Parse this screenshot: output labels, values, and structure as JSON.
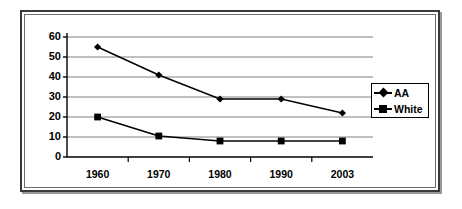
{
  "chart_data": {
    "type": "line",
    "title": "",
    "subtitle": "",
    "xlabel": "",
    "ylabel": "",
    "categories": [
      "1960",
      "1970",
      "1980",
      "1990",
      "2003"
    ],
    "series": [
      {
        "name": "AA",
        "marker": "diamond",
        "color": "#000000",
        "values": [
          55,
          41,
          29,
          29,
          22
        ]
      },
      {
        "name": "White",
        "marker": "square",
        "color": "#000000",
        "values": [
          20,
          10.5,
          8,
          8,
          8
        ]
      }
    ],
    "ylim": [
      0,
      60
    ],
    "y_ticks": [
      0,
      10,
      20,
      30,
      40,
      50,
      60
    ],
    "y_tick_labels": [
      "0",
      "10",
      "20",
      "30",
      "40",
      "50",
      "60"
    ],
    "grid": {
      "horizontal": true,
      "vertical": false,
      "color": "#808080"
    },
    "legend": {
      "position": "right",
      "entries": [
        {
          "label": "AA",
          "marker": "diamond"
        },
        {
          "label": "White",
          "marker": "square"
        }
      ]
    },
    "axis_color": "#000000",
    "frame": {
      "outer_border_color": "#3a3a3a",
      "inner_border_color": "#6e6e6e",
      "background": "#ffffff"
    }
  }
}
